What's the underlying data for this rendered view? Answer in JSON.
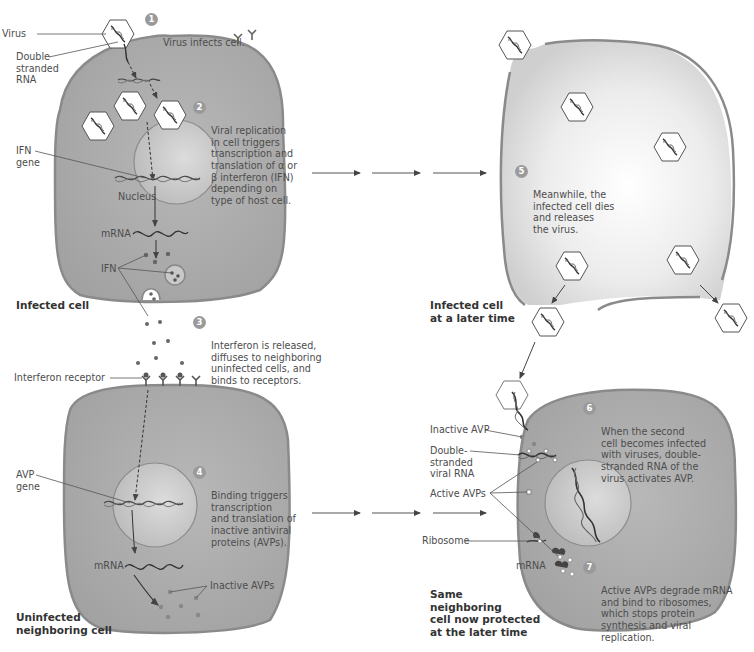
{
  "diagram": {
    "colors": {
      "cell_fill": "#a9a9a9",
      "cell_membrane": "#8a8a8a",
      "nucleus_fill": "#c9c9c9",
      "dead_cell_fill": "#d6d6d6",
      "step_badge": "#9a9a9a",
      "text": "#4d4d4d",
      "arrow": "#555555"
    },
    "panels": {
      "infected_cell": {
        "title": "Infected cell",
        "labels": {
          "virus": "Virus",
          "dsrna": "Double\nstranded\nRNA",
          "ifn_gene": "IFN\ngene",
          "nucleus": "Nucleus",
          "mrna": "mRNA",
          "ifn": "IFN"
        }
      },
      "dead_cell": {
        "title": "Infected cell\nat a later time"
      },
      "uninfected_cell": {
        "title": "Uninfected\nneighboring cell",
        "labels": {
          "interferon_receptor": "Interferon receptor",
          "avp_gene": "AVP\ngene",
          "mrna": "mRNA",
          "inactive_avps": "Inactive AVPs"
        }
      },
      "protected_cell": {
        "title": "Same\nneighboring\ncell now protected\nat the later time",
        "labels": {
          "inactive_avp": "Inactive AVP",
          "dsrna": "Double-\nstranded\nviral RNA",
          "active_avps": "Active AVPs",
          "ribosome": "Ribosome",
          "mrna": "mRNA"
        }
      }
    },
    "steps": [
      {
        "num": "1",
        "text": "Virus infects cell."
      },
      {
        "num": "2",
        "text": "Viral replication\nin cell triggers\ntranscription and\ntranslation of α or\nβ interferon (IFN)\ndepending on\ntype of host cell."
      },
      {
        "num": "3",
        "text": "Interferon is released,\ndiffuses to neighboring\nuninfected cells, and\nbinds to receptors."
      },
      {
        "num": "4",
        "text": "Binding triggers\ntranscription\nand translation of\ninactive antiviral\nproteins (AVPs)."
      },
      {
        "num": "5",
        "text": "Meanwhile, the\ninfected cell dies\nand releases\nthe virus."
      },
      {
        "num": "6",
        "text": "When the second\ncell becomes infected\nwith viruses, double-\nstranded RNA of the\nvirus activates AVP."
      },
      {
        "num": "7",
        "text": "Active AVPs degrade mRNA\nand bind to ribosomes,\nwhich stops protein\nsynthesis and viral\nreplication."
      }
    ]
  }
}
